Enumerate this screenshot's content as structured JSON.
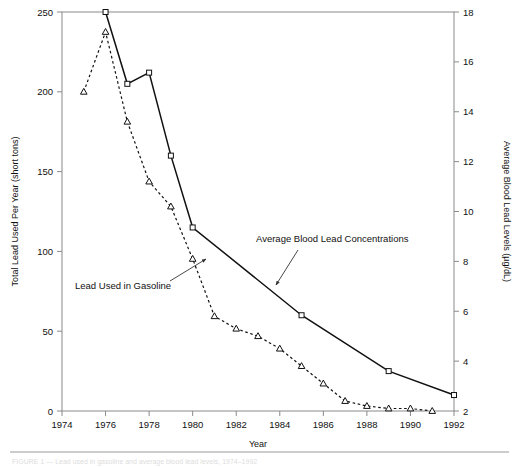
{
  "figure": {
    "caption": "FIGURE 1 — Lead used in gasoline and average blood lead levels, 1974–1992"
  },
  "chart_data": {
    "type": "line",
    "title": "",
    "xlabel": "Year",
    "ylabel": "Total Lead Used Per Year (short tons)",
    "y2label": "Average Blood Lead Levels (µg/dL)",
    "grid": false,
    "legend_position": "inline-annotations",
    "xlim": [
      1974,
      1992
    ],
    "xticks": [
      1974,
      1976,
      1978,
      1980,
      1982,
      1984,
      1986,
      1988,
      1990,
      1992
    ],
    "xtick_labels": [
      "1974",
      "1976",
      "1978",
      "1980",
      "1982",
      "1984",
      "1986",
      "1988",
      "1990",
      "1992"
    ],
    "ylim": [
      0,
      250
    ],
    "yticks": [
      0,
      50,
      100,
      150,
      200,
      250
    ],
    "ytick_labels": [
      "0",
      "50",
      "100",
      "150",
      "200",
      "250"
    ],
    "y2lim": [
      2,
      18
    ],
    "y2ticks": [
      2,
      4,
      6,
      8,
      10,
      12,
      14,
      16,
      18
    ],
    "y2tick_labels": [
      "2",
      "4",
      "6",
      "8",
      "10",
      "12",
      "14",
      "16",
      "18"
    ],
    "series": [
      {
        "name": "Lead Used in Gasoline",
        "axis": "left",
        "style": "solid",
        "marker": "square",
        "x": [
          1976,
          1977,
          1978,
          1979,
          1980,
          1985,
          1989,
          1992
        ],
        "values": [
          250,
          205,
          212,
          160,
          115,
          60,
          25,
          10
        ]
      },
      {
        "name": "Average Blood Lead Concentrations",
        "axis": "right",
        "style": "dotted",
        "marker": "triangle",
        "x": [
          1975,
          1976,
          1977,
          1978,
          1979,
          1980,
          1981,
          1982,
          1983,
          1984,
          1985,
          1986,
          1987,
          1988,
          1989,
          1990,
          1991
        ],
        "values": [
          14.8,
          17.2,
          13.6,
          11.2,
          10.2,
          8.1,
          5.8,
          5.3,
          5.0,
          4.5,
          3.8,
          3.1,
          2.4,
          2.2,
          2.1,
          2.1,
          2.0
        ]
      }
    ],
    "annotations": [
      {
        "text": "Lead Used in Gasoline",
        "label_x": 75,
        "label_y": 289,
        "arrow_from_x": 170,
        "arrow_from_y": 281,
        "arrow_to_x": 206,
        "arrow_to_y": 259
      },
      {
        "text": "Average Blood Lead Concentrations",
        "label_x": 256,
        "label_y": 242,
        "arrow_from_x": 298,
        "arrow_from_y": 250,
        "arrow_to_x": 276,
        "arrow_to_y": 285
      }
    ]
  }
}
